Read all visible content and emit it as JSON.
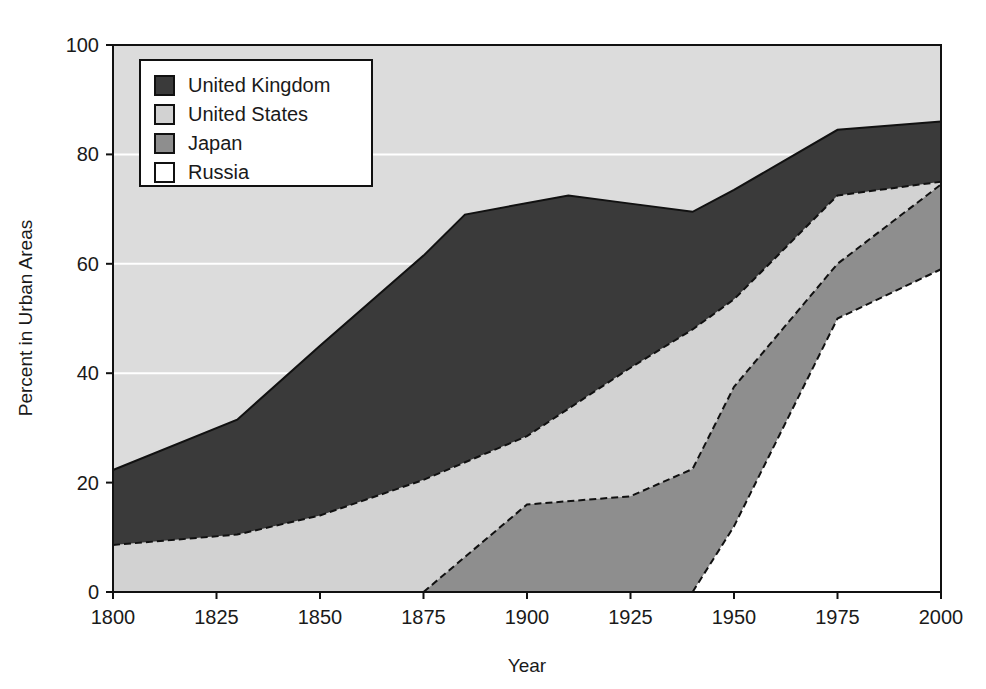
{
  "chart_data": {
    "type": "area",
    "title": "",
    "subtitle": "",
    "xlabel": "Year",
    "ylabel": "Percent in Urban Areas",
    "xlim": [
      1800,
      2000
    ],
    "ylim": [
      0,
      100
    ],
    "xticks": [
      1800,
      1825,
      1850,
      1875,
      1900,
      1925,
      1950,
      1975,
      2000
    ],
    "yticks": [
      0,
      20,
      40,
      60,
      80,
      100
    ],
    "xtick_labels": [
      "1800",
      "1825",
      "1850",
      "1875",
      "1900",
      "1925",
      "1950",
      "1975",
      "2000"
    ],
    "ytick_labels": [
      "0",
      "20",
      "40",
      "60",
      "80",
      "100"
    ],
    "grid": "horizontal-white",
    "stacked": false,
    "legend_position": "top-left",
    "legend_entries": [
      {
        "label": "United Kingdom",
        "color": "#3a3a3a"
      },
      {
        "label": "United States",
        "color": "#d2d2d2"
      },
      {
        "label": "Japan",
        "color": "#8e8e8e"
      },
      {
        "label": "Russia",
        "color": "#ffffff"
      }
    ],
    "series": [
      {
        "name": "United Kingdom",
        "color": "#3a3a3a",
        "x": [
          1800,
          1830,
          1850,
          1875,
          1885,
          1910,
          1925,
          1940,
          1950,
          1975,
          2000
        ],
        "values": [
          22.3,
          31.5,
          45.0,
          61.5,
          69.0,
          72.5,
          71.0,
          69.5,
          73.5,
          84.5,
          86.0
        ]
      },
      {
        "name": "United States",
        "color": "#d2d2d2",
        "x": [
          1800,
          1830,
          1850,
          1875,
          1900,
          1925,
          1940,
          1950,
          1975,
          2000
        ],
        "values": [
          8.6,
          10.5,
          14.0,
          20.5,
          28.5,
          41.0,
          48.0,
          53.5,
          72.5,
          75.0
        ]
      },
      {
        "name": "Japan",
        "color": "#8e8e8e",
        "x": [
          1875,
          1900,
          1925,
          1940,
          1950,
          1975,
          2000
        ],
        "values": [
          0.0,
          16.0,
          17.5,
          22.5,
          37.5,
          60.0,
          74.5
        ]
      },
      {
        "name": "Russia",
        "color": "#ffffff",
        "x": [
          1940,
          1950,
          1975,
          2000
        ],
        "values": [
          0.0,
          12.0,
          50.0,
          59.0
        ]
      }
    ]
  },
  "plot": {
    "background": "#dcdcdc",
    "gridline_color": "#ffffff",
    "frame_color": "#111111",
    "page_background": "#ffffff"
  }
}
